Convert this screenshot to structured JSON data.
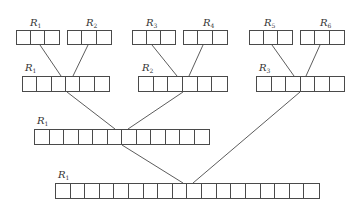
{
  "diagram": {
    "title": "",
    "levels": [
      {
        "level": 1,
        "runs": [
          {
            "id": "l1-r1",
            "label": "R",
            "sub": "1",
            "cells": 3,
            "x": 16,
            "y": 30,
            "w": 44,
            "h": 15,
            "label_x": 30,
            "label_y": 18
          },
          {
            "id": "l1-r2",
            "label": "R",
            "sub": "2",
            "cells": 3,
            "x": 67,
            "y": 30,
            "w": 45,
            "h": 15,
            "label_x": 86,
            "label_y": 18
          },
          {
            "id": "l1-r3",
            "label": "R",
            "sub": "3",
            "cells": 3,
            "x": 132,
            "y": 30,
            "w": 44,
            "h": 15,
            "label_x": 146,
            "label_y": 18
          },
          {
            "id": "l1-r4",
            "label": "R",
            "sub": "4",
            "cells": 3,
            "x": 183,
            "y": 30,
            "w": 45,
            "h": 15,
            "label_x": 203,
            "label_y": 18
          },
          {
            "id": "l1-r5",
            "label": "R",
            "sub": "5",
            "cells": 3,
            "x": 249,
            "y": 30,
            "w": 44,
            "h": 15,
            "label_x": 264,
            "label_y": 18
          },
          {
            "id": "l1-r6",
            "label": "R",
            "sub": "6",
            "cells": 3,
            "x": 300,
            "y": 30,
            "w": 45,
            "h": 15,
            "label_x": 320,
            "label_y": 18
          }
        ]
      },
      {
        "level": 2,
        "runs": [
          {
            "id": "l2-r1",
            "label": "R",
            "sub": "1",
            "cells": 6,
            "x": 22,
            "y": 76,
            "w": 88,
            "h": 16,
            "label_x": 25,
            "label_y": 63
          },
          {
            "id": "l2-r2",
            "label": "R",
            "sub": "2",
            "cells": 6,
            "x": 138,
            "y": 76,
            "w": 90,
            "h": 16,
            "label_x": 142,
            "label_y": 63
          },
          {
            "id": "l2-r3",
            "label": "R",
            "sub": "3",
            "cells": 6,
            "x": 256,
            "y": 76,
            "w": 89,
            "h": 16,
            "label_x": 259,
            "label_y": 63
          }
        ]
      },
      {
        "level": 3,
        "runs": [
          {
            "id": "l3-r1",
            "label": "R",
            "sub": "1",
            "cells": 12,
            "x": 34,
            "y": 129,
            "w": 176,
            "h": 16,
            "label_x": 37,
            "label_y": 116
          }
        ]
      },
      {
        "level": 4,
        "runs": [
          {
            "id": "l4-r1",
            "label": "R",
            "sub": "1",
            "cells": 18,
            "x": 55,
            "y": 183,
            "w": 265,
            "h": 16,
            "label_x": 58,
            "label_y": 170
          }
        ]
      }
    ],
    "edges": [
      {
        "from": "l1-r1",
        "to": "l2-r1",
        "x1": 40,
        "y1": 45,
        "x2": 61,
        "y2": 76
      },
      {
        "from": "l1-r2",
        "to": "l2-r1",
        "x1": 88,
        "y1": 45,
        "x2": 73,
        "y2": 76
      },
      {
        "from": "l1-r3",
        "to": "l2-r2",
        "x1": 152,
        "y1": 45,
        "x2": 177,
        "y2": 76
      },
      {
        "from": "l1-r4",
        "to": "l2-r2",
        "x1": 203,
        "y1": 45,
        "x2": 189,
        "y2": 76
      },
      {
        "from": "l1-r5",
        "to": "l2-r3",
        "x1": 272,
        "y1": 45,
        "x2": 294,
        "y2": 76
      },
      {
        "from": "l1-r6",
        "to": "l2-r3",
        "x1": 320,
        "y1": 45,
        "x2": 306,
        "y2": 76
      },
      {
        "from": "l2-r1",
        "to": "l3-r1",
        "x1": 67,
        "y1": 92,
        "x2": 115,
        "y2": 129
      },
      {
        "from": "l2-r2",
        "to": "l3-r1",
        "x1": 183,
        "y1": 92,
        "x2": 128,
        "y2": 129
      },
      {
        "from": "l2-r1",
        "to": "l4-r1",
        "x1": 0,
        "y1": 0,
        "x2": 0,
        "y2": 0,
        "hidden": true
      },
      {
        "from": "l3-r1",
        "to": "l4-r1",
        "x1": 122,
        "y1": 145,
        "x2": 183,
        "y2": 183
      },
      {
        "from": "l2-r3",
        "to": "l4-r1",
        "x1": 300,
        "y1": 92,
        "x2": 193,
        "y2": 183
      }
    ]
  }
}
